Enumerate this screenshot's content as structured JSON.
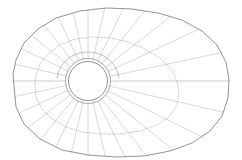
{
  "figure": {
    "canvas": {
      "width": 242,
      "height": 160,
      "background": "#ffffff"
    }
  },
  "chart_data": {
    "type": "scatter",
    "title": "",
    "subtitle": "",
    "xlabel": "",
    "ylabel": "",
    "grid": true,
    "legend": null,
    "center": {
      "x": 88,
      "y": 81
    },
    "ring_count": 4,
    "spoke_count": 28,
    "colors": {
      "outer_boundary": "#5a5a62",
      "dotted_ring": "#9a9aa4",
      "inner_ring": "#5f5f68",
      "collar_ring": "#8a8a93",
      "spoke": "#b7b7c0",
      "background": "#ffffff"
    },
    "rings": [
      {
        "name": "inner-hub-core",
        "style": "solid",
        "radius_x": 19.5,
        "radius_y": 19.5,
        "center_x": 88,
        "center_y": 81
      },
      {
        "name": "inner-hub-shell",
        "style": "solid",
        "radius_x": 22.5,
        "radius_y": 22.5,
        "center_x": 88,
        "center_y": 81
      },
      {
        "name": "collar-ring",
        "style": "solid-polygon",
        "radius_x": 30,
        "radius_y": 28,
        "center_x": 88,
        "center_y": 81
      },
      {
        "name": "mid-ring",
        "style": "dotted",
        "radius_x": 72,
        "radius_y": 48,
        "center_x": 103,
        "center_y": 82
      },
      {
        "name": "outer-boundary",
        "style": "solid-polygon",
        "radius_x": 104,
        "radius_y": 72,
        "center_x": 118,
        "center_y": 80
      }
    ],
    "outer_boundary_points": [
      [
        14,
        86
      ],
      [
        16,
        107
      ],
      [
        24,
        124
      ],
      [
        40,
        139
      ],
      [
        62,
        150
      ],
      [
        88,
        155
      ],
      [
        116,
        157
      ],
      [
        144,
        156
      ],
      [
        170,
        151
      ],
      [
        192,
        143
      ],
      [
        210,
        131
      ],
      [
        222,
        116
      ],
      [
        228,
        98
      ],
      [
        229,
        80
      ],
      [
        226,
        62
      ],
      [
        217,
        45
      ],
      [
        202,
        31
      ],
      [
        182,
        20
      ],
      [
        158,
        13
      ],
      [
        132,
        9
      ],
      [
        106,
        8
      ],
      [
        80,
        11
      ],
      [
        56,
        18
      ],
      [
        38,
        29
      ],
      [
        24,
        43
      ],
      [
        16,
        60
      ],
      [
        13,
        74
      ]
    ],
    "mid_ring_points": [
      [
        35,
        84
      ],
      [
        36,
        97
      ],
      [
        42,
        109
      ],
      [
        52,
        119
      ],
      [
        66,
        127
      ],
      [
        82,
        132
      ],
      [
        100,
        134
      ],
      [
        120,
        134
      ],
      [
        140,
        131
      ],
      [
        157,
        125
      ],
      [
        170,
        116
      ],
      [
        177,
        105
      ],
      [
        179,
        93
      ],
      [
        177,
        81
      ],
      [
        171,
        69
      ],
      [
        160,
        58
      ],
      [
        145,
        49
      ],
      [
        128,
        42
      ],
      [
        110,
        38
      ],
      [
        92,
        37
      ],
      [
        75,
        39
      ],
      [
        60,
        45
      ],
      [
        48,
        54
      ],
      [
        40,
        64
      ],
      [
        36,
        74
      ]
    ],
    "spokes": [
      {
        "angle_deg": 0,
        "kind": "equator",
        "from_radius": 22.5,
        "to": "boundary"
      },
      {
        "angle_deg": 13,
        "kind": "normal",
        "from_radius": 22.5,
        "to": "boundary"
      },
      {
        "angle_deg": 26,
        "kind": "normal",
        "from_radius": 22.5,
        "to": "boundary"
      },
      {
        "angle_deg": 39,
        "kind": "normal",
        "from_radius": 22.5,
        "to": "boundary"
      },
      {
        "angle_deg": 52,
        "kind": "normal",
        "from_radius": 22.5,
        "to": "boundary"
      },
      {
        "angle_deg": 64,
        "kind": "normal",
        "from_radius": 22.5,
        "to": "boundary"
      },
      {
        "angle_deg": 77,
        "kind": "normal",
        "from_radius": 22.5,
        "to": "boundary"
      },
      {
        "angle_deg": 90,
        "kind": "normal",
        "from_radius": 22.5,
        "to": "boundary"
      },
      {
        "angle_deg": 103,
        "kind": "normal",
        "from_radius": 22.5,
        "to": "boundary"
      },
      {
        "angle_deg": 116,
        "kind": "normal",
        "from_radius": 22.5,
        "to": "boundary"
      },
      {
        "angle_deg": 129,
        "kind": "normal",
        "from_radius": 22.5,
        "to": "boundary"
      },
      {
        "angle_deg": 142,
        "kind": "normal",
        "from_radius": 22.5,
        "to": "boundary"
      },
      {
        "angle_deg": 155,
        "kind": "normal",
        "from_radius": 22.5,
        "to": "boundary"
      },
      {
        "angle_deg": 168,
        "kind": "normal",
        "from_radius": 22.5,
        "to": "boundary"
      },
      {
        "angle_deg": 180,
        "kind": "equator",
        "from_radius": 22.5,
        "to": "boundary"
      },
      {
        "angle_deg": 193,
        "kind": "normal",
        "from_radius": 22.5,
        "to": "boundary"
      },
      {
        "angle_deg": 206,
        "kind": "normal",
        "from_radius": 22.5,
        "to": "boundary"
      },
      {
        "angle_deg": 219,
        "kind": "normal",
        "from_radius": 22.5,
        "to": "boundary"
      },
      {
        "angle_deg": 232,
        "kind": "normal",
        "from_radius": 22.5,
        "to": "boundary"
      },
      {
        "angle_deg": 245,
        "kind": "normal",
        "from_radius": 22.5,
        "to": "boundary"
      },
      {
        "angle_deg": 258,
        "kind": "normal",
        "from_radius": 22.5,
        "to": "boundary"
      },
      {
        "angle_deg": 270,
        "kind": "normal",
        "from_radius": 22.5,
        "to": "boundary"
      },
      {
        "angle_deg": 283,
        "kind": "normal",
        "from_radius": 22.5,
        "to": "boundary"
      },
      {
        "angle_deg": 296,
        "kind": "normal",
        "from_radius": 22.5,
        "to": "boundary"
      },
      {
        "angle_deg": 309,
        "kind": "normal",
        "from_radius": 22.5,
        "to": "boundary"
      },
      {
        "angle_deg": 322,
        "kind": "normal",
        "from_radius": 22.5,
        "to": "boundary"
      },
      {
        "angle_deg": 335,
        "kind": "normal",
        "from_radius": 22.5,
        "to": "boundary"
      },
      {
        "angle_deg": 348,
        "kind": "normal",
        "from_radius": 22.5,
        "to": "boundary"
      }
    ],
    "collar_arc": {
      "start_angle_deg": 186,
      "end_angle_deg": 354,
      "radius_x": 31,
      "radius_y": 29
    }
  }
}
